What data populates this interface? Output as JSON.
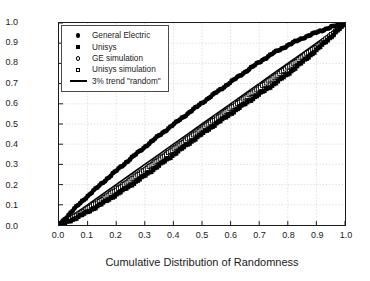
{
  "chart_data": {
    "type": "line",
    "title": "",
    "xlabel": "Cumulative Distribution of Randomness",
    "ylabel": "Fraction of Inventors with at Least this Randomness",
    "xlim": [
      0.0,
      1.0
    ],
    "ylim": [
      0.0,
      1.0
    ],
    "grid": true,
    "legend_position": "top-left",
    "xticks": [
      "0.0",
      "0.1",
      "0.2",
      "0.3",
      "0.4",
      "0.5",
      "0.6",
      "0.7",
      "0.8",
      "0.9",
      "1.0"
    ],
    "yticks": [
      "0.0",
      "0.1",
      "0.2",
      "0.3",
      "0.4",
      "0.5",
      "0.6",
      "0.7",
      "0.8",
      "0.9",
      "1.0"
    ],
    "x": [
      0.0,
      0.05,
      0.1,
      0.15,
      0.2,
      0.25,
      0.3,
      0.35,
      0.4,
      0.45,
      0.5,
      0.55,
      0.6,
      0.65,
      0.7,
      0.75,
      0.8,
      0.85,
      0.9,
      0.95,
      1.0
    ],
    "series": [
      {
        "name": "General Electric",
        "marker": "filled-circle",
        "color": "#000000",
        "values": [
          0.0,
          0.075,
          0.143,
          0.206,
          0.268,
          0.328,
          0.386,
          0.443,
          0.497,
          0.551,
          0.604,
          0.656,
          0.707,
          0.757,
          0.806,
          0.851,
          0.889,
          0.924,
          0.953,
          0.979,
          1.0
        ]
      },
      {
        "name": "Unisys",
        "marker": "filled-square",
        "color": "#000000",
        "values": [
          0.0,
          0.028,
          0.065,
          0.106,
          0.15,
          0.196,
          0.245,
          0.296,
          0.348,
          0.4,
          0.452,
          0.502,
          0.551,
          0.6,
          0.648,
          0.696,
          0.748,
          0.806,
          0.866,
          0.93,
          1.0
        ]
      },
      {
        "name": "GE simulation",
        "marker": "open-circle",
        "color": "#000000",
        "values": [
          0.0,
          0.041,
          0.085,
          0.131,
          0.179,
          0.228,
          0.278,
          0.329,
          0.38,
          0.431,
          0.482,
          0.533,
          0.584,
          0.634,
          0.684,
          0.734,
          0.784,
          0.834,
          0.884,
          0.94,
          1.0
        ]
      },
      {
        "name": "Unisys simulation",
        "marker": "open-square",
        "color": "#000000",
        "values": [
          0.0,
          0.038,
          0.08,
          0.125,
          0.172,
          0.221,
          0.271,
          0.322,
          0.373,
          0.424,
          0.475,
          0.526,
          0.577,
          0.628,
          0.678,
          0.729,
          0.78,
          0.831,
          0.882,
          0.938,
          1.0
        ]
      },
      {
        "name": "3% trend \"random\"",
        "marker": "line",
        "color": "#000000",
        "values": [
          0.0,
          0.05,
          0.1,
          0.15,
          0.2,
          0.25,
          0.3,
          0.35,
          0.4,
          0.45,
          0.5,
          0.55,
          0.6,
          0.65,
          0.7,
          0.75,
          0.8,
          0.85,
          0.9,
          0.95,
          1.0
        ]
      }
    ]
  },
  "legend": {
    "items": [
      {
        "label": "General Electric",
        "marker": "filled-circle"
      },
      {
        "label": "Unisys",
        "marker": "filled-square"
      },
      {
        "label": "GE simulation",
        "marker": "open-circle"
      },
      {
        "label": "Unisys simulation",
        "marker": "open-square"
      },
      {
        "label": "3% trend \"random\"",
        "marker": "line"
      }
    ]
  }
}
